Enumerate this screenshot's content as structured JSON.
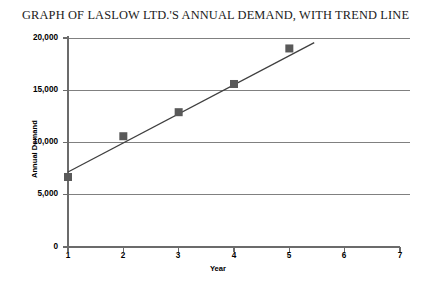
{
  "chart_data": {
    "type": "scatter",
    "title": "GRAPH OF LASLOW LTD.'S ANNUAL DEMAND, WITH TREND LINE",
    "xlabel": "Year",
    "ylabel": "Annual Demand",
    "x": [
      1,
      2,
      3,
      4,
      5
    ],
    "values": [
      6700,
      10600,
      12900,
      15600,
      19000
    ],
    "series": [
      {
        "name": "Annual Demand",
        "marker": "square",
        "color": "#595959",
        "values": [
          6700,
          10600,
          12900,
          15600,
          19000
        ]
      },
      {
        "name": "Trend line",
        "type": "line",
        "color": "#3f3f3f",
        "x_range": [
          1,
          5.45
        ],
        "y_range": [
          7180,
          19560
        ]
      }
    ],
    "xlim": [
      1,
      7
    ],
    "ylim": [
      0,
      20000
    ],
    "xticks": [
      1,
      2,
      3,
      4,
      5,
      6,
      7
    ],
    "xtick_labels": [
      "1",
      "2",
      "3",
      "4",
      "5",
      "6",
      "7"
    ],
    "yticks": [
      0,
      5000,
      10000,
      15000,
      20000
    ],
    "ytick_labels": [
      "0",
      "5,000",
      "10,000",
      "15,000",
      "20,000"
    ],
    "grid": "horizontal",
    "legend": "none",
    "gridline_color": "#808080",
    "axis_color": "#6b6b6b"
  }
}
